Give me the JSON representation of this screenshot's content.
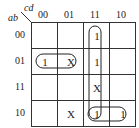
{
  "kmap": {
    "row_var": "ab",
    "col_var": "cd",
    "col_headers": [
      "00",
      "01",
      "11",
      "10"
    ],
    "row_headers": [
      "00",
      "01",
      "11",
      "10"
    ],
    "cells": [
      [
        "",
        "",
        "1",
        ""
      ],
      [
        "1",
        "X",
        "1",
        ""
      ],
      [
        "",
        "",
        "X",
        ""
      ],
      [
        "",
        "X",
        "1",
        "1"
      ]
    ],
    "groups": [
      {
        "name": "row-01-pair",
        "cells": [
          [
            1,
            0
          ],
          [
            1,
            1
          ]
        ]
      },
      {
        "name": "column-11-quad",
        "cells": [
          [
            0,
            2
          ],
          [
            1,
            2
          ],
          [
            2,
            2
          ],
          [
            3,
            2
          ]
        ]
      },
      {
        "name": "row-10-pair",
        "cells": [
          [
            3,
            2
          ],
          [
            3,
            3
          ]
        ]
      }
    ]
  }
}
